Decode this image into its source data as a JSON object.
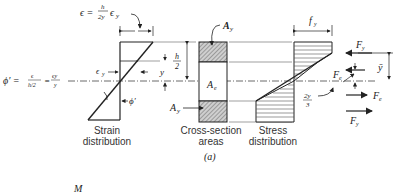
{
  "figure_label": "(a)",
  "bottom_label": "M",
  "strain": {
    "title_line1": "Strain",
    "title_line2": "distribution",
    "epsilon_eq_lhs": "ϵ = ",
    "epsilon_num": "h",
    "epsilon_den": "2y",
    "epsilon_tail": "ϵ",
    "epsilon_sub": "y",
    "eps_y": "ϵ",
    "eps_y_sub": "y",
    "phi_prime": "ϕ′",
    "h_num": "h",
    "h_den": "2",
    "y_label": "y"
  },
  "curvature": {
    "lhs": "ϕ′ =",
    "frac1_num": "ϵ",
    "frac1_den": "h/2",
    "eq": "=",
    "frac2_num": "ϵy",
    "frac2_den": "y"
  },
  "cross_section": {
    "title_line1": "Cross-section",
    "title_line2": "areas",
    "A_y_top": "A",
    "A_y_top_sub": "y",
    "A_e": "A",
    "A_e_sub": "e",
    "A_y_bottom": "A",
    "A_y_bottom_sub": "y"
  },
  "stress": {
    "title_line1": "Stress",
    "title_line2": "distribution",
    "f_y": "f",
    "f_y_sub": "y",
    "two_y_num": "2y",
    "two_y_den": "3"
  },
  "forces": {
    "F_y_top": "F",
    "F_y_top_sub": "y",
    "F_e_top": "F",
    "F_e_top_sub": "e",
    "F_e_bottom": "F",
    "F_e_bottom_sub": "e",
    "F_y_bottom": "F",
    "F_y_bottom_sub": "y",
    "ybar": "ȳ"
  }
}
